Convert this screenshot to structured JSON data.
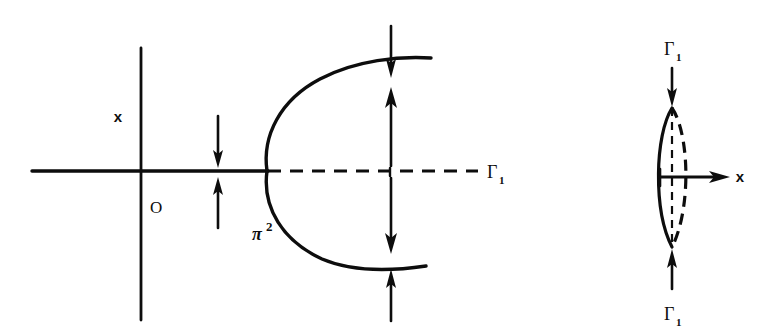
{
  "figure": {
    "background_color": "#ffffff",
    "ink_color": "#0d0d0d",
    "width": 760,
    "height": 331
  },
  "left_panel": {
    "name": "parabola-phase-diagram",
    "axis_vertical_label": "x",
    "origin_label": "O",
    "curve_label_base": "π",
    "curve_label_exponent": "2",
    "dashed_axis_label_base": "Γ",
    "dashed_axis_label_sub": "1",
    "axes": {
      "horizontal": {
        "x1": 32,
        "y1": 171,
        "x2": 267,
        "y2": 171
      },
      "vertical": {
        "x1": 141,
        "y1": 48,
        "x2": 141,
        "y2": 320
      }
    },
    "dashed_axis": {
      "x1": 267,
      "y1": 171,
      "x2": 476,
      "y2": 171
    },
    "parabola": {
      "vertex_x": 267,
      "vertex_y": 171,
      "upper_end_x": 431,
      "upper_end_y": 58,
      "lower_end_x": 426,
      "lower_end_y": 266
    },
    "arrows": [
      {
        "name": "arrow-inner-down-left",
        "x": 218,
        "y1": 116,
        "y2": 166,
        "dir": "down"
      },
      {
        "name": "arrow-inner-up-left",
        "x": 218,
        "y1": 226,
        "y2": 177,
        "dir": "up"
      },
      {
        "name": "arrow-outer-down-top",
        "x": 391,
        "y1": 26,
        "y2": 77,
        "dir": "down"
      },
      {
        "name": "arrow-inner-up-top",
        "x": 391,
        "y1": 165,
        "y2": 88,
        "dir": "up"
      },
      {
        "name": "arrow-inner-down-bot",
        "x": 391,
        "y1": 177,
        "y2": 252,
        "dir": "down"
      },
      {
        "name": "arrow-outer-up-bot",
        "x": 391,
        "y1": 320,
        "y2": 268,
        "dir": "up"
      }
    ]
  },
  "right_panel": {
    "name": "lens-region-diagram",
    "axis_label": "x",
    "top_label_base": "Γ",
    "top_label_sub": "1",
    "bottom_label_base": "Γ",
    "bottom_label_sub": "1",
    "lens": {
      "center_x": 672,
      "top_y": 108,
      "bottom_y": 247,
      "half_width": 16
    },
    "center_axis_dashed": {
      "x": 672,
      "y1": 108,
      "y2": 247
    },
    "x_arrow": {
      "x1": 672,
      "y1": 177,
      "x2": 730,
      "y2": 177
    },
    "tick_mark": {
      "x": 660,
      "y1": 169,
      "y2": 186
    },
    "arrows": [
      {
        "name": "arrow-top-inward",
        "x": 672,
        "y1": 68,
        "y2": 106,
        "dir": "down"
      },
      {
        "name": "arrow-bottom-inward",
        "x": 672,
        "y1": 288,
        "y2": 250,
        "dir": "up"
      }
    ]
  }
}
